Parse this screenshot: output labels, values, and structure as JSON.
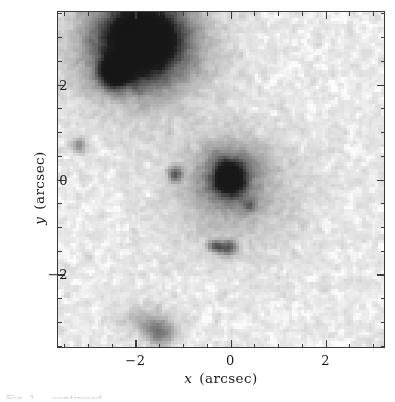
{
  "figure": {
    "title": "",
    "caption_fragment": "Fig. 1 — continued"
  },
  "axes": {
    "x": {
      "label_symbol": "x",
      "label_unit": "(arcsec)",
      "label_full": "x  (arcsec)",
      "ticks_major": [
        -2,
        0,
        2
      ],
      "tick_labels": [
        "−2",
        "0",
        "2"
      ],
      "range": [
        -3.65,
        3.25
      ],
      "minor_step": 0.5,
      "tick_direction": "in"
    },
    "y": {
      "label_symbol": "y",
      "label_unit": "(arcsec)",
      "label_full": "y  (arcsec)",
      "ticks_major": [
        2,
        0,
        -2
      ],
      "tick_labels": [
        "2",
        "0",
        "−2"
      ],
      "range": [
        -3.55,
        3.55
      ],
      "minor_step": 0.5,
      "tick_direction": "in"
    }
  },
  "colors": {
    "background": "#ffffff",
    "sky_level": "#e9e9e9",
    "frame": "#3a3a3a",
    "text": "#1a1a1a",
    "darkest_source": "#1c1c1c"
  },
  "chart_data": {
    "type": "heatmap",
    "title": "",
    "xlabel": "x  (arcsec)",
    "ylabel": "y  (arcsec)",
    "xlim": [
      -3.65,
      3.25
    ],
    "ylim": [
      -3.55,
      3.55
    ],
    "grid": false,
    "legend": "none",
    "colormap": "grayscale_inverted",
    "sky_background_value": 0.1,
    "noise_amplitude": 0.06,
    "sources": [
      {
        "name": "northwest-bright-galaxy",
        "x": -1.85,
        "y": 2.95,
        "peak": 1.0,
        "radius_x": 0.78,
        "radius_y": 0.72,
        "shape": "elliptical-core"
      },
      {
        "name": "northwest-galaxy-halo",
        "x": -1.9,
        "y": 2.8,
        "peak": 0.42,
        "radius_x": 1.35,
        "radius_y": 1.25,
        "shape": "diffuse-halo"
      },
      {
        "name": "northwest-companion-knot",
        "x": -2.45,
        "y": 2.25,
        "peak": 0.92,
        "radius_x": 0.3,
        "radius_y": 0.27,
        "shape": "compact-knot"
      },
      {
        "name": "central-nucleus",
        "x": -0.02,
        "y": 0.02,
        "peak": 0.95,
        "radius_x": 0.26,
        "radius_y": 0.3,
        "shape": "compact-nucleus"
      },
      {
        "name": "central-inner-envelope",
        "x": 0.0,
        "y": 0.08,
        "peak": 0.38,
        "radius_x": 0.62,
        "radius_y": 0.6,
        "shape": "envelope"
      },
      {
        "name": "central-outer-halo",
        "x": 0.08,
        "y": -0.3,
        "peak": 0.2,
        "radius_x": 1.35,
        "radius_y": 1.2,
        "shape": "faint-halo"
      },
      {
        "name": "west-point-source",
        "x": -1.15,
        "y": 0.1,
        "peak": 0.55,
        "radius_x": 0.14,
        "radius_y": 0.14,
        "shape": "point"
      },
      {
        "name": "far-west-faint-source",
        "x": -3.2,
        "y": 0.72,
        "peak": 0.38,
        "radius_x": 0.14,
        "radius_y": 0.14,
        "shape": "point"
      },
      {
        "name": "southeast-faint-knot",
        "x": 0.42,
        "y": -0.55,
        "peak": 0.4,
        "radius_x": 0.12,
        "radius_y": 0.12,
        "shape": "point"
      },
      {
        "name": "south-knot-left",
        "x": -0.3,
        "y": -1.42,
        "peak": 0.55,
        "radius_x": 0.14,
        "radius_y": 0.12,
        "shape": "point"
      },
      {
        "name": "south-knot-right",
        "x": -0.02,
        "y": -1.45,
        "peak": 0.58,
        "radius_x": 0.16,
        "radius_y": 0.13,
        "shape": "point"
      },
      {
        "name": "south-edge-diffuse-blob",
        "x": -1.45,
        "y": -3.25,
        "peak": 0.4,
        "radius_x": 0.3,
        "radius_y": 0.28,
        "shape": "diffuse"
      },
      {
        "name": "south-edge-faint-arc",
        "x": -1.85,
        "y": -3.0,
        "peak": 0.2,
        "radius_x": 0.45,
        "radius_y": 0.3,
        "shape": "diffuse"
      }
    ]
  }
}
